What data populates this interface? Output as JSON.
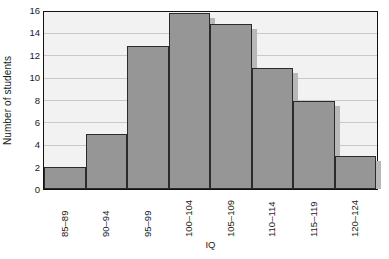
{
  "chart_data": {
    "type": "bar",
    "title": "",
    "xlabel": "IQ",
    "ylabel": "Number of students",
    "categories": [
      "85–89",
      "90–94",
      "95–99",
      "100–104",
      "105–109",
      "110–114",
      "115–119",
      "120–124"
    ],
    "values": [
      2,
      5,
      13,
      16,
      15,
      11,
      8,
      3
    ],
    "ylim": [
      0,
      16
    ],
    "ytick_labels": [
      "0",
      "2",
      "4",
      "6",
      "8",
      "10",
      "12",
      "14",
      "16"
    ],
    "ytick_values": [
      0,
      2,
      4,
      6,
      8,
      10,
      12,
      14,
      16
    ],
    "grid": "horizontal",
    "legend": "none",
    "series_name": "Number of students",
    "bar_fill_color": "#969696",
    "bar_edge_color": "#2b2b2b",
    "bar_shadow_color": "#b8b8b8",
    "plot_background_color": "#f2f2f2",
    "gridline_color": "#c9c9c9",
    "frame_color": "#121212",
    "text_color": "#1a1a1a"
  }
}
